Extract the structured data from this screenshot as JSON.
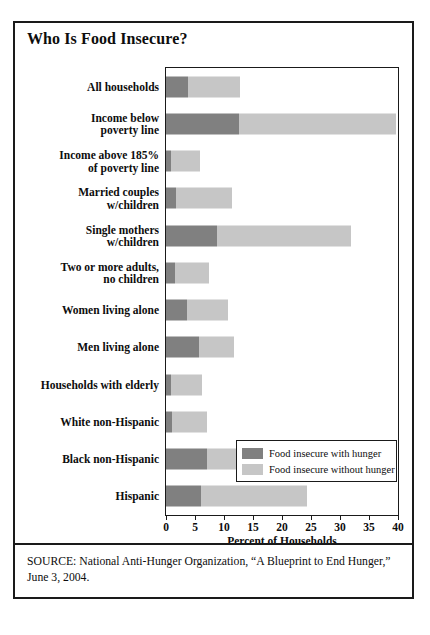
{
  "figure": {
    "title": "Who Is Food Insecure?",
    "source": "SOURCE: National Anti-Hunger Organization, “A Blueprint to End Hunger,” June 3, 2004."
  },
  "legend": {
    "items": [
      {
        "label": "Food insecure with hunger",
        "color": "#808080"
      },
      {
        "label": "Food insecure without hunger",
        "color": "#c6c6c6"
      }
    ]
  },
  "chart_data": {
    "type": "bar",
    "orientation": "horizontal",
    "stacked": true,
    "title": "Who Is Food Insecure?",
    "xlabel": "Percent of Households",
    "ylabel": "",
    "xlim": [
      0,
      40
    ],
    "xticks": [
      0,
      5,
      10,
      15,
      20,
      25,
      30,
      35,
      40
    ],
    "xticklabels": [
      "0",
      "5",
      "10",
      "15",
      "20",
      "25",
      "30",
      "35",
      "40"
    ],
    "grid": false,
    "legend_position": "inside-right",
    "categories": [
      "All households",
      "Income below poverty line",
      "Income above 185% of poverty line",
      "Married couples w/children",
      "Single mothers w/children",
      "Two or more adults, no children",
      "Women living alone",
      "Men living alone",
      "Households with elderly",
      "White non-Hispanic",
      "Black non-Hispanic",
      "Hispanic"
    ],
    "category_lines": [
      [
        "All households"
      ],
      [
        "Income below",
        "poverty line"
      ],
      [
        "Income above 185%",
        "of poverty line"
      ],
      [
        "Married couples",
        "w/children"
      ],
      [
        "Single mothers",
        "w/children"
      ],
      [
        "Two or more adults,",
        "no children"
      ],
      [
        "Women living alone"
      ],
      [
        "Men living alone"
      ],
      [
        "Households with elderly"
      ],
      [
        "White non-Hispanic"
      ],
      [
        "Black non-Hispanic"
      ],
      [
        "Hispanic"
      ]
    ],
    "series": [
      {
        "name": "Food insecure with hunger",
        "color": "#808080",
        "values": [
          3.8,
          12.6,
          0.9,
          1.7,
          8.8,
          1.5,
          3.7,
          5.7,
          0.9,
          1.0,
          7.1,
          6.0
        ]
      },
      {
        "name": "Food insecure without hunger",
        "color": "#c6c6c6",
        "values": [
          8.9,
          27.1,
          5.0,
          9.7,
          23.1,
          5.9,
          7.0,
          6.0,
          5.3,
          6.1,
          15.7,
          18.3
        ]
      }
    ],
    "totals": [
      12.7,
      39.7,
      5.9,
      11.4,
      31.9,
      7.4,
      10.7,
      11.7,
      6.2,
      7.1,
      22.8,
      24.3
    ]
  }
}
